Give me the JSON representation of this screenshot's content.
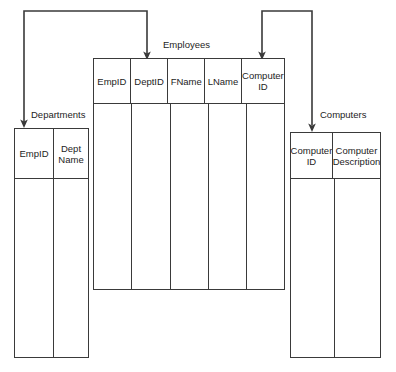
{
  "diagram": {
    "type": "database-schema-relationship-diagram",
    "background_color": "#ffffff",
    "line_color": "#3a3a3a",
    "text_color": "#1d1d1d",
    "entities": [
      {
        "id": "departments",
        "label": "Departments",
        "columns": [
          {
            "id": "dept-empid",
            "label": "EmpID",
            "lines": [
              "EmpID"
            ]
          },
          {
            "id": "dept-name",
            "label": "Dept Name",
            "lines": [
              "Dept",
              "Name"
            ]
          }
        ]
      },
      {
        "id": "employees",
        "label": "Employees",
        "columns": [
          {
            "id": "emp-empid",
            "label": "EmpID",
            "lines": [
              "EmpID"
            ]
          },
          {
            "id": "emp-deptid",
            "label": "DeptID",
            "lines": [
              "DeptID"
            ]
          },
          {
            "id": "emp-fname",
            "label": "FName",
            "lines": [
              "FName"
            ]
          },
          {
            "id": "emp-lname",
            "label": "LName",
            "lines": [
              "LName"
            ]
          },
          {
            "id": "emp-computerid",
            "label": "Computer ID",
            "lines": [
              "Computer",
              "ID"
            ]
          }
        ]
      },
      {
        "id": "computers",
        "label": "Computers",
        "columns": [
          {
            "id": "comp-computerid",
            "label": "Computer ID",
            "lines": [
              "Computer",
              "ID"
            ]
          },
          {
            "id": "comp-description",
            "label": "Computer Description",
            "lines": [
              "Computer",
              "Description"
            ]
          }
        ]
      }
    ],
    "relationships": [
      {
        "id": "departments-to-employees-deptid",
        "from": "departments.EmpID",
        "to": "employees.DeptID",
        "arrow_heads": [
          "departments.EmpID",
          "employees.DeptID"
        ]
      },
      {
        "id": "employees-computerid-to-computers",
        "from": "employees.Computer ID",
        "to": "computers.Computer ID",
        "arrow_heads": [
          "employees.Computer ID",
          "computers.Computer ID"
        ]
      }
    ]
  }
}
